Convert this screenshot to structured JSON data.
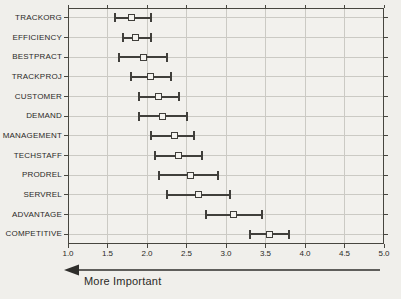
{
  "figure": {
    "title": "",
    "arrow_label": "More Important"
  },
  "colors": {
    "page_background": "#f0efeb",
    "plot_background": "#f2f1ed",
    "frame": "#47463f",
    "gridline": "#cbcac4",
    "errorbar": "#403f3b",
    "marker_fill": "#f4f3ef",
    "text": "#2b2a27"
  },
  "chart_data": {
    "type": "scatter",
    "style": "means-plot-with-error-bars",
    "orientation": "horizontal",
    "title": "",
    "xlabel": "",
    "ylabel": "",
    "arrow_label": "More Important",
    "arrow_direction": "left",
    "axis_note": "arrow points toward 1.0: lower score = more important",
    "xlim": [
      1.0,
      5.0
    ],
    "x_ticks": [
      1.0,
      1.5,
      2.0,
      2.5,
      3.0,
      3.5,
      4.0,
      4.5,
      5.0
    ],
    "x_tick_labels": [
      "1.0",
      "1.5",
      "2.0",
      "2.5",
      "3.0",
      "3.5",
      "4.0",
      "4.5",
      "5.0"
    ],
    "grid": true,
    "categories": [
      "TRACKORG",
      "EFFICIENCY",
      "BESTPRACT",
      "TRACKPROJ",
      "CUSTOMER",
      "DEMAND",
      "MANAGEMENT",
      "TECHSTAFF",
      "PRODREL",
      "SERVREL",
      "ADVANTAGE",
      "COMPETITIVE"
    ],
    "series": [
      {
        "name": "mean importance rating with confidence interval",
        "points": [
          {
            "category": "TRACKORG",
            "mean": 1.8,
            "ci_low": 1.6,
            "ci_high": 2.05
          },
          {
            "category": "EFFICIENCY",
            "mean": 1.85,
            "ci_low": 1.7,
            "ci_high": 2.05
          },
          {
            "category": "BESTPRACT",
            "mean": 1.95,
            "ci_low": 1.65,
            "ci_high": 2.25
          },
          {
            "category": "TRACKPROJ",
            "mean": 2.05,
            "ci_low": 1.8,
            "ci_high": 2.3
          },
          {
            "category": "CUSTOMER",
            "mean": 2.15,
            "ci_low": 1.9,
            "ci_high": 2.4
          },
          {
            "category": "DEMAND",
            "mean": 2.2,
            "ci_low": 1.9,
            "ci_high": 2.5
          },
          {
            "category": "MANAGEMENT",
            "mean": 2.35,
            "ci_low": 2.05,
            "ci_high": 2.6
          },
          {
            "category": "TECHSTAFF",
            "mean": 2.4,
            "ci_low": 2.1,
            "ci_high": 2.7
          },
          {
            "category": "PRODREL",
            "mean": 2.55,
            "ci_low": 2.15,
            "ci_high": 2.9
          },
          {
            "category": "SERVREL",
            "mean": 2.65,
            "ci_low": 2.25,
            "ci_high": 3.05
          },
          {
            "category": "ADVANTAGE",
            "mean": 3.1,
            "ci_low": 2.75,
            "ci_high": 3.45
          },
          {
            "category": "COMPETITIVE",
            "mean": 3.55,
            "ci_low": 3.3,
            "ci_high": 3.8
          }
        ]
      }
    ],
    "legend": null
  }
}
